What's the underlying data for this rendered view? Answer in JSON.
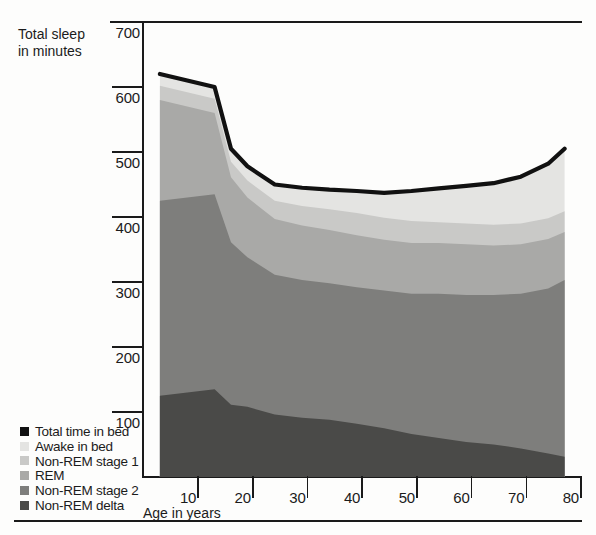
{
  "figure": {
    "y_axis_title": "Total sleep\nin minutes",
    "x_axis_title": "Age in years"
  },
  "legend": {
    "items": [
      {
        "label": "Total time in bed",
        "color": "#111111"
      },
      {
        "label": "Awake in bed",
        "color": "#e4e4e2"
      },
      {
        "label": "Non-REM stage 1",
        "color": "#c9c9c7"
      },
      {
        "label": "REM",
        "color": "#a9a9a7"
      },
      {
        "label": "Non-REM stage 2",
        "color": "#7e7e7c"
      },
      {
        "label": "Non-REM delta",
        "color": "#4a4a48"
      }
    ]
  },
  "chart_data": {
    "type": "area",
    "title": "",
    "subtitle": "",
    "xlabel": "Age in years",
    "ylabel": "Total sleep in minutes",
    "xlim": [
      0,
      80
    ],
    "ylim": [
      0,
      700
    ],
    "xticks": [
      10,
      20,
      30,
      40,
      50,
      60,
      70,
      80
    ],
    "yticks": [
      100,
      200,
      300,
      400,
      500,
      600,
      700
    ],
    "grid": false,
    "legend_position": "bottom-left-outside",
    "stacked": true,
    "stack_order_bottom_to_top": [
      "Non-REM delta",
      "Non-REM stage 2",
      "REM",
      "Non-REM stage 1",
      "Awake in bed"
    ],
    "x": [
      3,
      8,
      13,
      16,
      19,
      24,
      29,
      34,
      39,
      44,
      49,
      54,
      59,
      64,
      69,
      74,
      77
    ],
    "series": [
      {
        "name": "Total time in bed",
        "kind": "line",
        "color": "#111111",
        "values": [
          620,
          610,
          600,
          505,
          478,
          450,
          445,
          442,
          440,
          437,
          440,
          444,
          448,
          452,
          462,
          482,
          505
        ]
      },
      {
        "name": "Awake in bed",
        "kind": "band",
        "color": "#e4e4e2",
        "values": [
          18,
          18,
          18,
          20,
          22,
          25,
          28,
          30,
          34,
          38,
          46,
          52,
          58,
          64,
          72,
          84,
          96
        ]
      },
      {
        "name": "Non-REM stage 1",
        "kind": "band",
        "color": "#c9c9c7",
        "values": [
          22,
          22,
          22,
          24,
          26,
          28,
          30,
          32,
          34,
          34,
          34,
          32,
          32,
          32,
          32,
          32,
          32
        ]
      },
      {
        "name": "REM",
        "kind": "band",
        "color": "#a9a9a7",
        "values": [
          155,
          140,
          125,
          100,
          92,
          86,
          84,
          82,
          80,
          78,
          78,
          78,
          78,
          76,
          76,
          76,
          74
        ]
      },
      {
        "name": "Non-REM stage 2",
        "kind": "band",
        "color": "#7e7e7c",
        "values": [
          300,
          300,
          300,
          250,
          230,
          215,
          212,
          210,
          210,
          212,
          216,
          222,
          226,
          230,
          238,
          254,
          272
        ]
      },
      {
        "name": "Non-REM delta",
        "kind": "band",
        "color": "#4a4a48",
        "values": [
          125,
          130,
          135,
          111,
          108,
          96,
          91,
          88,
          82,
          75,
          66,
          60,
          54,
          50,
          44,
          36,
          31
        ]
      }
    ],
    "cumulative_tops": {
      "note": "upper boundary of each stacked band, bottom-to-top, in minutes",
      "Non-REM delta": [
        125,
        130,
        135,
        111,
        108,
        96,
        91,
        88,
        82,
        75,
        66,
        60,
        54,
        50,
        44,
        36,
        31
      ],
      "Non-REM stage 2": [
        425,
        430,
        435,
        361,
        338,
        311,
        303,
        298,
        292,
        287,
        282,
        282,
        280,
        280,
        282,
        290,
        303
      ],
      "REM": [
        580,
        570,
        560,
        461,
        430,
        397,
        387,
        380,
        372,
        365,
        360,
        360,
        358,
        356,
        358,
        366,
        377
      ],
      "Non-REM stage 1": [
        602,
        592,
        582,
        485,
        456,
        425,
        417,
        412,
        406,
        399,
        394,
        392,
        390,
        388,
        390,
        398,
        409
      ],
      "Awake in bed": [
        620,
        610,
        600,
        505,
        478,
        450,
        445,
        442,
        440,
        437,
        440,
        444,
        448,
        452,
        462,
        482,
        505
      ]
    }
  }
}
